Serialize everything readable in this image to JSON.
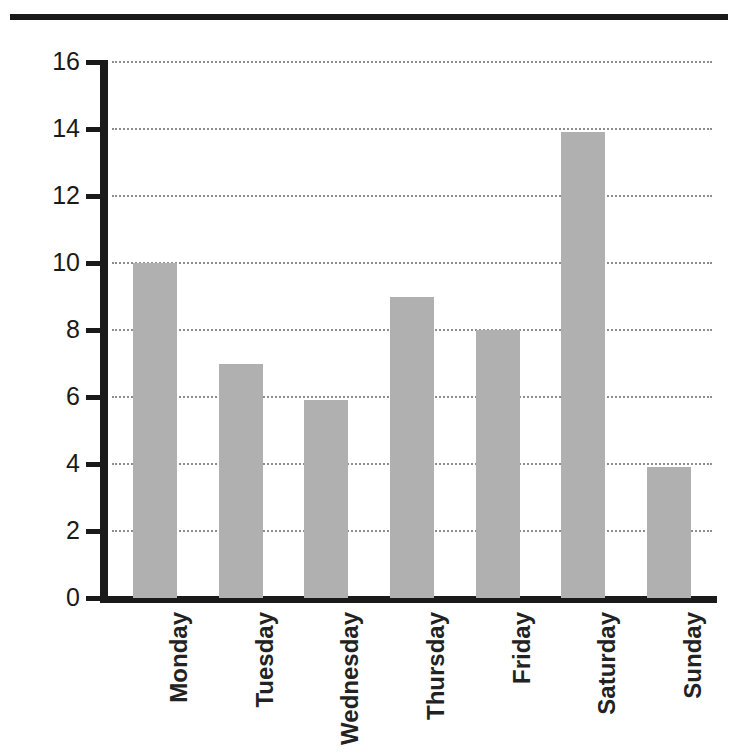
{
  "heading_fragment": "g",
  "chart_data": {
    "type": "bar",
    "title": "",
    "subtitle": "",
    "xlabel": "",
    "ylabel": "",
    "categories": [
      "Monday",
      "Tuesday",
      "Wednesday",
      "Thursday",
      "Friday",
      "Saturday",
      "Sunday"
    ],
    "values": [
      10.0,
      7.0,
      5.9,
      9.0,
      8.0,
      13.9,
      3.9
    ],
    "series": [
      {
        "name": "",
        "values": [
          10.0,
          7.0,
          5.9,
          9.0,
          8.0,
          13.9,
          3.9
        ]
      }
    ],
    "ylim": [
      0,
      16
    ],
    "yticks": [
      0,
      2,
      4,
      6,
      8,
      10,
      12,
      14,
      16
    ],
    "ytick_labels": [
      "0",
      "2",
      "4",
      "6",
      "8",
      "10",
      "12",
      "14",
      "16"
    ],
    "grid": true,
    "grid_axis": "y",
    "grid_style": "dotted",
    "legend": false,
    "legend_position": "none",
    "bar_color": "#b0b0b0",
    "axis_color": "#1a1a1a",
    "grid_color": "#8d8d8d",
    "xtick_rotation": -90
  }
}
